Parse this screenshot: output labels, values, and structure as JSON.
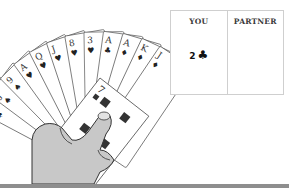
{
  "table": {
    "columns": [
      {
        "label": "YOU",
        "played_rank": "2",
        "played_suit": "♣"
      },
      {
        "label": "PARTNER",
        "played_rank": "",
        "played_suit": ""
      }
    ]
  },
  "hand": {
    "cards": [
      {
        "rank": "10",
        "suit": "♠"
      },
      {
        "rank": "J",
        "suit": "♠"
      },
      {
        "rank": "9",
        "suit": "♠"
      },
      {
        "rank": "A",
        "suit": "♥"
      },
      {
        "rank": "Q",
        "suit": "♥"
      },
      {
        "rank": "J",
        "suit": "♥"
      },
      {
        "rank": "8",
        "suit": "♥"
      },
      {
        "rank": "3",
        "suit": "♥"
      },
      {
        "rank": "A",
        "suit": "♣"
      },
      {
        "rank": "A",
        "suit": "♦"
      },
      {
        "rank": "K",
        "suit": "♦"
      },
      {
        "rank": "J",
        "suit": "♦"
      },
      {
        "rank": "7",
        "suit": "♦"
      }
    ]
  },
  "colors": {
    "card_outline": "#555555",
    "hand_fill": "#c8c8c8",
    "table_border": "#cfcfcf",
    "bottom_bar": "#8e8e8e"
  }
}
